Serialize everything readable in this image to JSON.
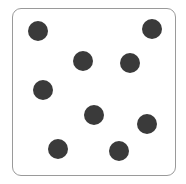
{
  "figure": {
    "dot_color": "#3a3a3a",
    "border_color": "#9a9a9a",
    "dot_count": 9,
    "dots": [
      {
        "x": 38,
        "y": 31
      },
      {
        "x": 152,
        "y": 29
      },
      {
        "x": 83,
        "y": 61
      },
      {
        "x": 130,
        "y": 63
      },
      {
        "x": 43,
        "y": 90
      },
      {
        "x": 94,
        "y": 115
      },
      {
        "x": 147,
        "y": 124
      },
      {
        "x": 58,
        "y": 149
      },
      {
        "x": 119,
        "y": 151
      }
    ]
  }
}
